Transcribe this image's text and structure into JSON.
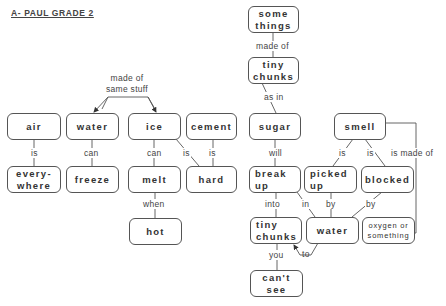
{
  "title": "A- PAUL GRADE 2",
  "nodes": {
    "some_things": "some things",
    "tiny_chunks_top": "tiny chunks",
    "air": "air",
    "water_top": "water",
    "ice": "ice",
    "cement": "cement",
    "sugar": "sugar",
    "smell": "smell",
    "everywhere": "every-where",
    "freeze": "freeze",
    "melt": "melt",
    "hard": "hard",
    "break_up": "break up",
    "picked_up": "picked up",
    "blocked": "blocked",
    "hot": "hot",
    "tiny_chunks_bottom": "tiny chunks",
    "water_bottom": "water",
    "oxygen": "oxygen or something",
    "cant_see": "can't see"
  },
  "links": {
    "made_of": "made of",
    "made_of_same_stuff": "made of same stuff",
    "as_in": "as in",
    "air_is": "is",
    "water_can": "can",
    "ice_can": "can",
    "ice_is": "is",
    "cement_is": "is",
    "sugar_will": "will",
    "smell_is_1": "is",
    "smell_is_2": "is",
    "smell_is_made_of": "is made of",
    "melt_when": "when",
    "break_into": "into",
    "break_in": "in",
    "picked_by": "by",
    "blocked_by": "by",
    "tiny_you": "you",
    "water_to": "to"
  },
  "colors": {
    "line": "#555555",
    "text": "#333333",
    "background": "#ffffff"
  }
}
